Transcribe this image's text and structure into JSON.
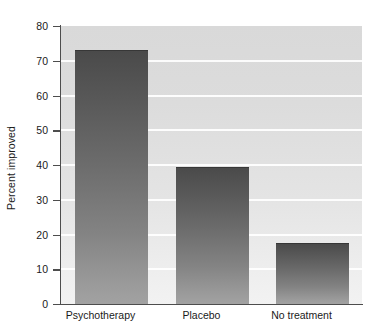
{
  "chart_data": {
    "type": "bar",
    "title": "",
    "xlabel": "",
    "ylabel": "Percent improved",
    "categories": [
      "Psychotherapy",
      "Placebo",
      "No treatment"
    ],
    "values": [
      73,
      39.5,
      17.5
    ],
    "ylim": [
      0,
      80
    ],
    "yticks": [
      0,
      10,
      20,
      30,
      40,
      50,
      60,
      70,
      80
    ],
    "ytick_labels": [
      "0",
      "10",
      "20",
      "30",
      "40",
      "50",
      "60",
      "70",
      "80"
    ],
    "grid": "horizontal-white-gridlines",
    "legend": "none",
    "colors": {
      "bar_top": "#4a4a4a",
      "bar_bottom": "#a2a2a2",
      "plot_background_top": "#d9d9d9",
      "plot_background_bottom": "#f2f2f2",
      "gridline": "#ffffff",
      "axis": "#4d4d4d",
      "text": "#1a1a1a"
    }
  }
}
